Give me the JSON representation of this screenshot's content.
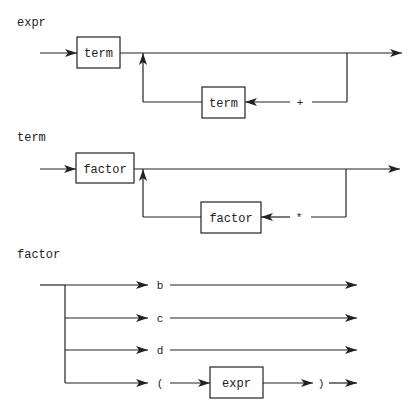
{
  "diagrams": {
    "expr": {
      "title": "expr",
      "main_box": "term",
      "loop_box": "term",
      "loop_symbol": "+"
    },
    "term": {
      "title": "term",
      "main_box": "factor",
      "loop_box": "factor",
      "loop_symbol": "*"
    },
    "factor": {
      "title": "factor",
      "alternatives": [
        {
          "symbol": "b"
        },
        {
          "symbol": "c"
        },
        {
          "symbol": "d"
        },
        {
          "symbol": "(",
          "box": "expr",
          "close_symbol": ")"
        }
      ]
    }
  },
  "colors": {
    "line": "#222222",
    "background": "#ffffff"
  }
}
